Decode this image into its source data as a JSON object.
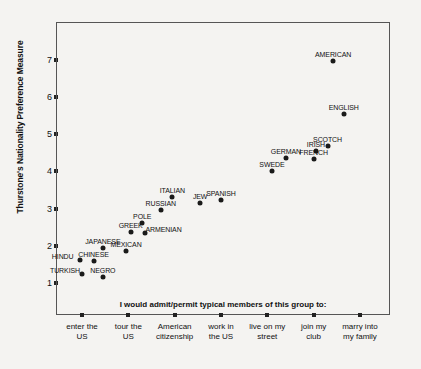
{
  "chart_data": {
    "type": "scatter",
    "title": "",
    "xlabel": "I would admit/permit typical members of this group to:",
    "ylabel": "Thurstone's Nationality Preference Measure",
    "categories": [
      "enter the\nUS",
      "tour the\nUS",
      "American\ncitizenship",
      "work in\nthe US",
      "live on my\nstreet",
      "join my\nclub",
      "marry into\nmy family"
    ],
    "xtick_labels_lines": [
      [
        "enter the",
        "US"
      ],
      [
        "tour the",
        "US"
      ],
      [
        "American",
        "citizenship"
      ],
      [
        "work in",
        "the US"
      ],
      [
        "live on my",
        "street"
      ],
      [
        "join my",
        "club"
      ],
      [
        "marry into",
        "my family"
      ]
    ],
    "ytick_labels": [
      "1",
      "2",
      "3",
      "4",
      "5",
      "6",
      "7"
    ],
    "ylim": [
      0.85,
      7.5
    ],
    "xlim": [
      0.5,
      7.5
    ],
    "grid": false,
    "legend": false,
    "points": [
      {
        "label": "TURKISH",
        "x": 1.0,
        "y": 1.25,
        "label_pos": "left"
      },
      {
        "label": "NEGRO",
        "x": 1.45,
        "y": 1.15,
        "label_pos": "above"
      },
      {
        "label": "HINDU",
        "x": 0.95,
        "y": 1.63,
        "label_pos": "left"
      },
      {
        "label": "CHINESE",
        "x": 1.25,
        "y": 1.6,
        "label_pos": "above"
      },
      {
        "label": "JAPANESE",
        "x": 1.45,
        "y": 1.95,
        "label_pos": "above"
      },
      {
        "label": "MEXICAN",
        "x": 1.95,
        "y": 1.85,
        "label_pos": "above"
      },
      {
        "label": "GREEK",
        "x": 2.05,
        "y": 2.38,
        "label_pos": "above"
      },
      {
        "label": "POLE",
        "x": 2.3,
        "y": 2.62,
        "label_pos": "above"
      },
      {
        "label": "ARMENIAN",
        "x": 2.35,
        "y": 2.35,
        "label_pos": "right"
      },
      {
        "label": "RUSSIAN",
        "x": 2.7,
        "y": 2.95,
        "label_pos": "above"
      },
      {
        "label": "ITALIAN",
        "x": 2.95,
        "y": 3.3,
        "label_pos": "above"
      },
      {
        "label": "JEW",
        "x": 3.55,
        "y": 3.15,
        "label_pos": "above"
      },
      {
        "label": "SPANISH",
        "x": 4.0,
        "y": 3.22,
        "label_pos": "above"
      },
      {
        "label": "SWEDE",
        "x": 5.1,
        "y": 4.0,
        "label_pos": "above"
      },
      {
        "label": "GERMAN",
        "x": 5.4,
        "y": 4.35,
        "label_pos": "above"
      },
      {
        "label": "IRISH",
        "x": 6.05,
        "y": 4.55,
        "label_pos": "above"
      },
      {
        "label": "SCOTCH",
        "x": 6.3,
        "y": 4.68,
        "label_pos": "above"
      },
      {
        "label": "FRENCH",
        "x": 6.0,
        "y": 4.33,
        "label_pos": "above"
      },
      {
        "label": "ENGLISH",
        "x": 6.65,
        "y": 5.55,
        "label_pos": "above"
      },
      {
        "label": "AMERICAN",
        "x": 6.42,
        "y": 6.98,
        "label_pos": "above"
      }
    ]
  },
  "colors": {
    "background": "#f4f3f1",
    "point": "#1a1a1a",
    "axis": "#555555",
    "text": "#111111"
  }
}
